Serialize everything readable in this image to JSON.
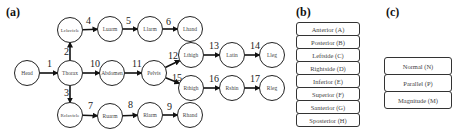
{
  "panels": {
    "a": {
      "label": "(a)"
    },
    "b": {
      "label": "(b)"
    },
    "c": {
      "label": "(c)"
    }
  },
  "graph": {
    "node_radius": 12.5,
    "nodes": [
      {
        "id": "Head",
        "label": "Head",
        "x": 27,
        "y": 73
      },
      {
        "id": "Thorax",
        "label": "Thorax",
        "x": 70,
        "y": 73
      },
      {
        "id": "Abdomen",
        "label": "Abdomen",
        "x": 112,
        "y": 73
      },
      {
        "id": "Pelvis",
        "label": "Pelvis",
        "x": 154,
        "y": 73
      },
      {
        "id": "Lclavicle",
        "label": "Lclavicle",
        "x": 70,
        "y": 30
      },
      {
        "id": "Luarm",
        "label": "Luarm",
        "x": 110,
        "y": 29
      },
      {
        "id": "Llarm",
        "label": "Llarm",
        "x": 150,
        "y": 29
      },
      {
        "id": "Lhand",
        "label": "Lhand",
        "x": 190,
        "y": 29
      },
      {
        "id": "Lthigh",
        "label": "Lthigh",
        "x": 191,
        "y": 55
      },
      {
        "id": "Latin",
        "label": "Latin",
        "x": 232,
        "y": 55
      },
      {
        "id": "Lleg",
        "label": "Lleg",
        "x": 272,
        "y": 55
      },
      {
        "id": "Rthigh",
        "label": "Rthigh",
        "x": 191,
        "y": 88
      },
      {
        "id": "Rshin",
        "label": "Rshin",
        "x": 232,
        "y": 88
      },
      {
        "id": "Rleg",
        "label": "Rleg",
        "x": 272,
        "y": 88
      },
      {
        "id": "Rclavicle",
        "label": "Rclavicle",
        "x": 70,
        "y": 115
      },
      {
        "id": "Ruarm",
        "label": "Ruarm",
        "x": 110,
        "y": 116
      },
      {
        "id": "Rlarm",
        "label": "Rlarm",
        "x": 150,
        "y": 115
      },
      {
        "id": "Rhand",
        "label": "Rhand",
        "x": 190,
        "y": 115
      }
    ],
    "edges": [
      {
        "n": "1",
        "from": "Head",
        "to": "Thorax",
        "lx": 47,
        "ly": 67
      },
      {
        "n": "2",
        "from": "Thorax",
        "to": "Lclavicle",
        "lx": 64,
        "ly": 55
      },
      {
        "n": "3",
        "from": "Thorax",
        "to": "Rclavicle",
        "lx": 64,
        "ly": 96
      },
      {
        "n": "4",
        "from": "Lclavicle",
        "to": "Luarm",
        "lx": 86,
        "ly": 24
      },
      {
        "n": "5",
        "from": "Luarm",
        "to": "Llarm",
        "lx": 126,
        "ly": 24
      },
      {
        "n": "6",
        "from": "Llarm",
        "to": "Lhand",
        "lx": 166,
        "ly": 25
      },
      {
        "n": "7",
        "from": "Rclavicle",
        "to": "Ruarm",
        "lx": 88,
        "ly": 109
      },
      {
        "n": "8",
        "from": "Ruarm",
        "to": "Rlarm",
        "lx": 128,
        "ly": 108
      },
      {
        "n": "9",
        "from": "Rlarm",
        "to": "Rhand",
        "lx": 167,
        "ly": 110
      },
      {
        "n": "10",
        "from": "Thorax",
        "to": "Abdomen",
        "lx": 90,
        "ly": 67
      },
      {
        "n": "11",
        "from": "Abdomen",
        "to": "Pelvis",
        "lx": 132,
        "ly": 67
      },
      {
        "n": "12",
        "from": "Pelvis",
        "to": "Lthigh",
        "lx": 168,
        "ly": 59
      },
      {
        "n": "13",
        "from": "Lthigh",
        "to": "Latin",
        "lx": 209,
        "ly": 49
      },
      {
        "n": "14",
        "from": "Latin",
        "to": "Lleg",
        "lx": 250,
        "ly": 49
      },
      {
        "n": "15",
        "from": "Pelvis",
        "to": "Rthigh",
        "lx": 172,
        "ly": 81
      },
      {
        "n": "16",
        "from": "Rthigh",
        "to": "Rshin",
        "lx": 209,
        "ly": 82
      },
      {
        "n": "17",
        "from": "Rshin",
        "to": "Rleg",
        "lx": 250,
        "ly": 82
      }
    ]
  },
  "directions_list": {
    "items": [
      "Anterior (A)",
      "Posterior (B)",
      "Leftside (C)",
      "Rightside (D)",
      "Inferior (E)",
      "Superior (F)",
      "Santerior (G)",
      "Sposterior (H)"
    ]
  },
  "measures_list": {
    "items": [
      "Normal (N)",
      "Parallel (P)",
      "Magnitude (M)"
    ]
  }
}
